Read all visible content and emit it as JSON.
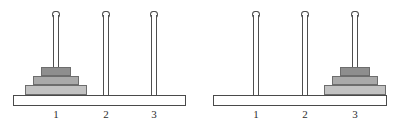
{
  "diagram": {
    "type": "tower-of-hanoi",
    "title": "",
    "disk_count": 3,
    "peg_count": 3,
    "colors": {
      "background": "#ffffff",
      "outline": "#4a4a4a",
      "peg_outline": "#4f4f4f",
      "disk_outline": "#6d6d6d",
      "disk_small": "#8e8e8e",
      "disk_medium": "#a9a9a9",
      "disk_large": "#c2c2c2",
      "label_text": "#2e2e2e"
    },
    "states": [
      {
        "name": "start-state",
        "pegs": [
          {
            "label": "1",
            "disks": [
              3,
              2,
              1
            ]
          },
          {
            "label": "2",
            "disks": []
          },
          {
            "label": "3",
            "disks": []
          }
        ]
      },
      {
        "name": "goal-state",
        "pegs": [
          {
            "label": "1",
            "disks": []
          },
          {
            "label": "2",
            "disks": []
          },
          {
            "label": "3",
            "disks": [
              3,
              2,
              1
            ]
          }
        ]
      }
    ],
    "disk_sizes": [
      {
        "id": 1,
        "name": "small-disk",
        "width": 30,
        "height": 9,
        "color": "#8e8e8e"
      },
      {
        "id": 2,
        "name": "medium-disk",
        "width": 46,
        "height": 9,
        "color": "#a9a9a9"
      },
      {
        "id": 3,
        "name": "large-disk",
        "width": 62,
        "height": 10,
        "color": "#c2c2c2"
      }
    ],
    "layout": {
      "scenes": [
        {
          "left": 0,
          "base_left": 13,
          "base_width": 173,
          "peg_x": [
            56,
            106,
            154
          ]
        },
        {
          "left": 0,
          "base_left": 213,
          "base_width": 174,
          "peg_x": [
            256,
            305,
            355
          ]
        }
      ],
      "base_top": 95,
      "base_height": 11,
      "peg_top": 11,
      "peg_height": 84,
      "peg_width": 6,
      "label_top": 108
    }
  }
}
